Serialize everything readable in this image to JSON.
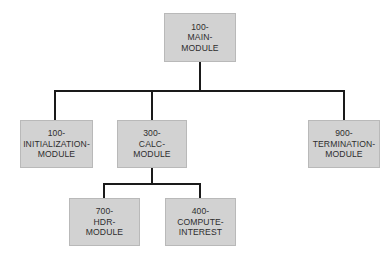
{
  "diagram": {
    "type": "hierarchy-chart",
    "nodes": {
      "main": {
        "id": "100-main",
        "lines": [
          "100-",
          "MAIN-",
          "MODULE"
        ]
      },
      "init": {
        "id": "100-init",
        "lines": [
          "100-",
          "INITIALIZATION-",
          "MODULE"
        ]
      },
      "calc": {
        "id": "300-calc",
        "lines": [
          "300-",
          "CALC-",
          "MODULE"
        ]
      },
      "term": {
        "id": "900-term",
        "lines": [
          "900-",
          "TERMINATION-",
          "MODULE"
        ]
      },
      "hdr": {
        "id": "700-hdr",
        "lines": [
          "700-",
          "HDR-",
          "MODULE"
        ]
      },
      "compute": {
        "id": "400-compute",
        "lines": [
          "400-",
          "COMPUTE-",
          "INTEREST"
        ]
      }
    },
    "edges": [
      {
        "from": "100-MAIN-MODULE",
        "to": "100-INITIALIZATION-MODULE"
      },
      {
        "from": "100-MAIN-MODULE",
        "to": "300-CALC-MODULE"
      },
      {
        "from": "100-MAIN-MODULE",
        "to": "900-TERMINATION-MODULE"
      },
      {
        "from": "300-CALC-MODULE",
        "to": "700-HDR-MODULE"
      },
      {
        "from": "300-CALC-MODULE",
        "to": "400-COMPUTE-INTEREST"
      }
    ],
    "colors": {
      "node_fill": "#d2d2d2",
      "node_border": "#b9b9b9",
      "text": "#2e2e2e",
      "connector": "#1a1a1a"
    }
  }
}
